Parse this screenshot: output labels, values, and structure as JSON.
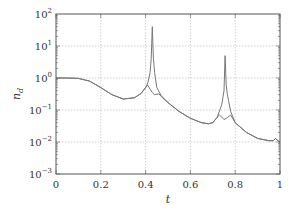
{
  "chart_data": {
    "type": "line",
    "title": "",
    "xlabel": "t",
    "ylabel": "n_d",
    "xlim": [
      0,
      1
    ],
    "ylim": [
      0.001,
      100
    ],
    "yscale": "log",
    "grid": true,
    "legend": null,
    "x_ticks": [
      "0",
      "0.2",
      "0.4",
      "0.6",
      "0.8",
      "1"
    ],
    "y_ticks": [
      "10^2",
      "10^1",
      "10^0",
      "10^-1",
      "10^-2",
      "10^-3"
    ],
    "series": [
      {
        "name": "spiked",
        "color": "#777777",
        "x": [
          0,
          0.05,
          0.1,
          0.15,
          0.2,
          0.25,
          0.3,
          0.35,
          0.38,
          0.4,
          0.41,
          0.42,
          0.425,
          0.43,
          0.435,
          0.44,
          0.45,
          0.47,
          0.5,
          0.55,
          0.6,
          0.65,
          0.68,
          0.7,
          0.72,
          0.74,
          0.75,
          0.755,
          0.76,
          0.765,
          0.77,
          0.78,
          0.8,
          0.85,
          0.9,
          0.95,
          0.97,
          0.98,
          0.99,
          1
        ],
        "y": [
          1.0,
          1.0,
          0.97,
          0.8,
          0.5,
          0.3,
          0.22,
          0.24,
          0.33,
          0.5,
          0.7,
          1.5,
          4,
          40,
          4,
          1.5,
          0.5,
          0.28,
          0.17,
          0.09,
          0.055,
          0.04,
          0.037,
          0.04,
          0.06,
          0.15,
          0.4,
          5,
          0.6,
          0.3,
          0.2,
          0.09,
          0.04,
          0.02,
          0.013,
          0.011,
          0.011,
          0.013,
          0.011,
          0.01
        ]
      },
      {
        "name": "smooth",
        "color": "#777777",
        "x": [
          0,
          0.05,
          0.1,
          0.15,
          0.2,
          0.25,
          0.3,
          0.35,
          0.38,
          0.4,
          0.41,
          0.42,
          0.43,
          0.44,
          0.46,
          0.47,
          0.5,
          0.55,
          0.6,
          0.65,
          0.68,
          0.7,
          0.72,
          0.73,
          0.74,
          0.75,
          0.76,
          0.78,
          0.8,
          0.85,
          0.9,
          0.95,
          0.97,
          0.98,
          0.99,
          1
        ],
        "y": [
          1.0,
          1.0,
          0.97,
          0.8,
          0.5,
          0.3,
          0.22,
          0.24,
          0.33,
          0.5,
          0.6,
          0.45,
          0.35,
          0.3,
          0.32,
          0.26,
          0.17,
          0.09,
          0.055,
          0.04,
          0.037,
          0.04,
          0.06,
          0.07,
          0.06,
          0.05,
          0.055,
          0.07,
          0.04,
          0.02,
          0.013,
          0.011,
          0.011,
          0.013,
          0.011,
          0.01
        ]
      }
    ]
  },
  "axes": {
    "xlabel": "t",
    "ylabel_main": "n",
    "ylabel_sub": "d",
    "x_tick_labels": [
      "0",
      "0.2",
      "0.4",
      "0.6",
      "0.8",
      "1"
    ],
    "y_tick_bases": [
      "10",
      "10",
      "10",
      "10",
      "10",
      "10"
    ],
    "y_tick_exps": [
      "2",
      "1",
      "0",
      "−1",
      "−2",
      "−3"
    ]
  }
}
